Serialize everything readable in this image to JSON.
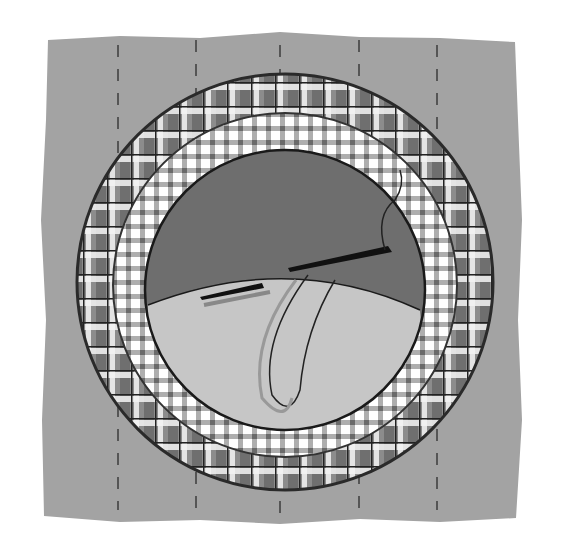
{
  "illustration": {
    "subject": "Appliqué circle being hand-stitched onto a fabric background with needle and thread",
    "colors": {
      "page": "#ffffff",
      "background_fabric": "#a3a3a3",
      "plaid_outer_base": "#8a8a8a",
      "plaid_inner_base": "#d8d8d8",
      "center_dark": "#6e6e6e",
      "center_light": "#c6c6c6",
      "outline": "#2a2a2a",
      "needle": "#1a1a1a",
      "basting": "#555555"
    },
    "elements": [
      "background-fabric-square",
      "basting-lines",
      "outer-plaid-ring",
      "inner-gingham-ring",
      "center-circle-dark",
      "center-circle-light-fold",
      "needle",
      "thread-loop"
    ]
  }
}
